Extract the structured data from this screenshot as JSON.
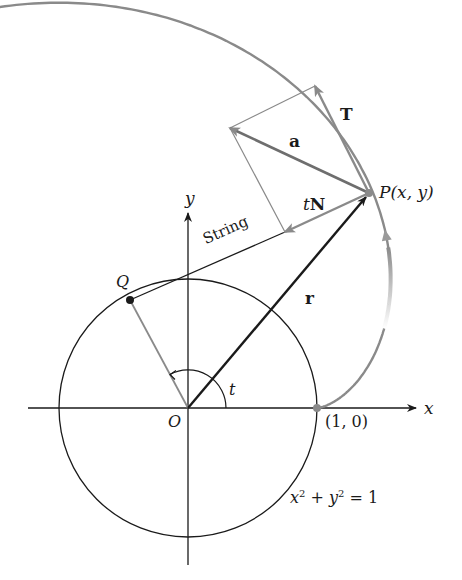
{
  "figure": {
    "width": 462,
    "height": 580,
    "colors": {
      "black": "#1a1a1a",
      "gray": "#8a8a8a",
      "gray_light": "#9a9a9a",
      "background": "#ffffff"
    },
    "origin": {
      "x": 188,
      "y": 408
    },
    "unit_radius_px": 129,
    "axes": {
      "x_start": 28,
      "x_end": 416,
      "y_top": 213,
      "y_bottom": 565
    },
    "points": {
      "P": {
        "x": 369,
        "y": 193
      },
      "Q": {
        "x": 130,
        "y": 300
      },
      "one_zero": {
        "x": 317,
        "y": 408
      },
      "T_tip": {
        "x": 315,
        "y": 86
      },
      "a_tip": {
        "x": 230,
        "y": 128
      },
      "tN_tip": {
        "x": 285,
        "y": 232
      }
    },
    "involute_t_max": 3.3
  },
  "labels": {
    "x_axis": "x",
    "y_axis": "y",
    "origin": "O",
    "angle": "t",
    "point_P": "P(x, y)",
    "point_Q": "Q",
    "point_one_zero": "(1, 0)",
    "string": "String",
    "vec_r": "r",
    "vec_a": "a",
    "vec_T": "T",
    "vec_tN_t": "t",
    "vec_tN_N": "N",
    "equation_x": "x",
    "equation_exp1": "2",
    "equation_plus": " + ",
    "equation_y": "y",
    "equation_exp2": "2",
    "equation_rest": " = 1"
  }
}
